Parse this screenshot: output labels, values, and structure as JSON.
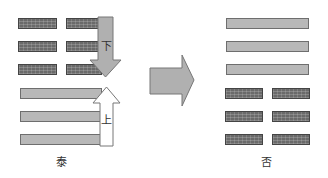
{
  "left_hexagram": {
    "name": "泰",
    "description": "Earth over Heaven",
    "top_trigram": "broken lines (yin) ×3",
    "bottom_trigram": "solid lines (yang) ×3",
    "down_arrow_label": "下",
    "up_arrow_label": "上"
  },
  "right_hexagram": {
    "name": "否",
    "description": "Heaven over Earth",
    "top_trigram": "solid lines (yang) ×3",
    "bottom_trigram": "broken lines (yin) ×3"
  },
  "transition_arrow": "right-arrow",
  "colors": {
    "yin_fill": "#6a6a6a",
    "yang_fill": "#b8b8b8",
    "arrow_fill": "#b0b0b0",
    "arrow_stroke": "#777777"
  }
}
